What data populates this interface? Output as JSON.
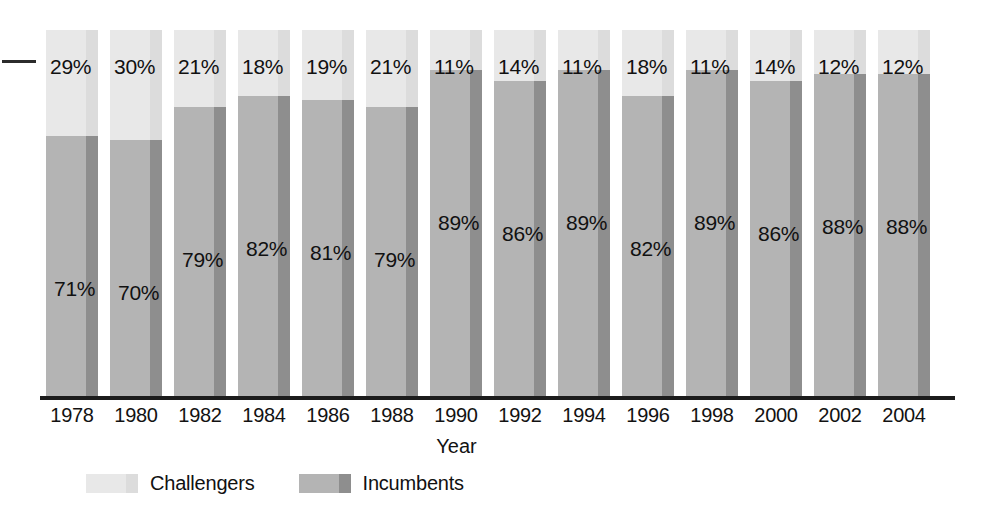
{
  "chart_data": {
    "type": "bar",
    "subtype": "stacked-percentage",
    "title": "",
    "xlabel": "Year",
    "ylabel": "",
    "ylim": [
      0,
      100
    ],
    "grid": false,
    "legend_position": "bottom-left",
    "categories": [
      "1978",
      "1980",
      "1982",
      "1984",
      "1986",
      "1988",
      "1990",
      "1992",
      "1994",
      "1996",
      "1998",
      "2000",
      "2002",
      "2004"
    ],
    "series": [
      {
        "name": "Challengers",
        "color": "#e8e8e8",
        "values": [
          29,
          30,
          21,
          18,
          19,
          21,
          11,
          14,
          11,
          18,
          11,
          14,
          12,
          12
        ],
        "labels": [
          "29%",
          "30%",
          "21%",
          "18%",
          "19%",
          "21%",
          "11%",
          "14%",
          "11%",
          "18%",
          "11%",
          "14%",
          "12%",
          "12%"
        ]
      },
      {
        "name": "Incumbents",
        "color": "#b4b4b4",
        "values": [
          71,
          70,
          79,
          82,
          81,
          79,
          89,
          86,
          89,
          82,
          89,
          86,
          88,
          88
        ],
        "labels": [
          "71%",
          "70%",
          "79%",
          "82%",
          "81%",
          "79%",
          "89%",
          "86%",
          "89%",
          "82%",
          "89%",
          "86%",
          "88%",
          "88%"
        ]
      }
    ]
  },
  "axis": {
    "title": "Year"
  },
  "legend": {
    "items": [
      {
        "label": "Challengers",
        "swatch": "challenger-swatch"
      },
      {
        "label": "Incumbents",
        "swatch": "incumbent-swatch"
      }
    ]
  },
  "marks": {
    "left_tick": "axis-tick-dash"
  }
}
